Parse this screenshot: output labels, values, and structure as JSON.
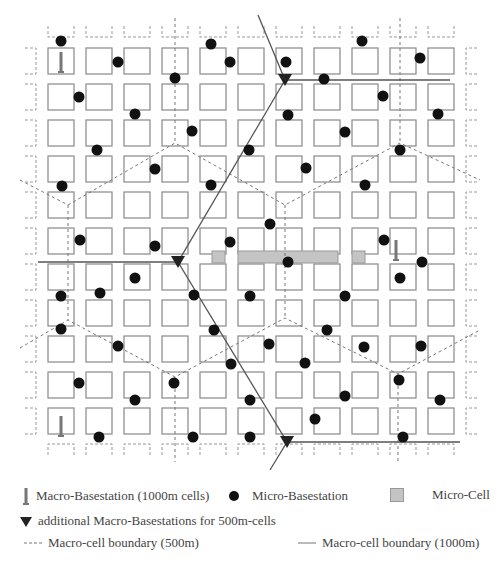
{
  "diagram": {
    "grid": {
      "cols": 11,
      "rows": 11,
      "x0": 48,
      "y0": 48,
      "pitch_x": 38,
      "pitch_y": 36,
      "cell_w": 26,
      "cell_h": 26
    },
    "colors": {
      "block_stroke": "#888888",
      "dot": "#111111",
      "micro_cell_fill": "#c4c4c4",
      "line": "#555555",
      "dashed": "#777777"
    },
    "macro_basestations_1000m": [
      [
        61,
        62
      ],
      [
        396,
        250
      ],
      [
        61,
        426
      ]
    ],
    "additional_macro_basestations_500m": [
      [
        285,
        80
      ],
      [
        178,
        262
      ],
      [
        287,
        442
      ]
    ],
    "micro_basestations": [
      [
        61,
        41
      ],
      [
        118,
        62
      ],
      [
        211,
        44
      ],
      [
        230,
        62
      ],
      [
        286,
        62
      ],
      [
        362,
        41
      ],
      [
        420,
        58
      ],
      [
        79,
        97
      ],
      [
        175,
        78
      ],
      [
        324,
        79
      ],
      [
        383,
        96
      ],
      [
        135,
        114
      ],
      [
        288,
        115
      ],
      [
        438,
        114
      ],
      [
        97,
        150
      ],
      [
        192,
        131
      ],
      [
        345,
        132
      ],
      [
        62,
        186
      ],
      [
        155,
        169
      ],
      [
        249,
        150
      ],
      [
        400,
        150
      ],
      [
        211,
        185
      ],
      [
        306,
        168
      ],
      [
        365,
        185
      ],
      [
        80,
        240
      ],
      [
        270,
        224
      ],
      [
        155,
        246
      ],
      [
        384,
        240
      ],
      [
        230,
        242
      ],
      [
        288,
        262
      ],
      [
        422,
        262
      ],
      [
        61,
        296
      ],
      [
        135,
        278
      ],
      [
        194,
        295
      ],
      [
        345,
        296
      ],
      [
        400,
        278
      ],
      [
        100,
        293
      ],
      [
        250,
        296
      ],
      [
        61,
        329
      ],
      [
        118,
        346
      ],
      [
        214,
        330
      ],
      [
        269,
        344
      ],
      [
        327,
        330
      ],
      [
        364,
        347
      ],
      [
        421,
        346
      ],
      [
        79,
        383
      ],
      [
        174,
        383
      ],
      [
        231,
        364
      ],
      [
        305,
        363
      ],
      [
        399,
        380
      ],
      [
        135,
        400
      ],
      [
        250,
        400
      ],
      [
        345,
        396
      ],
      [
        440,
        400
      ],
      [
        99,
        437
      ],
      [
        193,
        437
      ],
      [
        250,
        437
      ],
      [
        315,
        419
      ],
      [
        403,
        437
      ]
    ],
    "micro_cells": [
      [
        212,
        251,
        13,
        12
      ],
      [
        238,
        251,
        100,
        12
      ],
      [
        352,
        251,
        13,
        12
      ]
    ],
    "solid_lines": [
      [
        [
          258,
          15
        ],
        [
          285,
          80
        ],
        [
          178,
          262
        ],
        [
          287,
          442
        ],
        [
          270,
          470
        ]
      ],
      [
        [
          285,
          80
        ],
        [
          450,
          80
        ]
      ],
      [
        [
          38,
          262
        ],
        [
          178,
          262
        ]
      ],
      [
        [
          287,
          442
        ],
        [
          460,
          442
        ]
      ]
    ],
    "dashed_lines": [
      [
        [
          20,
          180
        ],
        [
          68,
          205
        ],
        [
          175,
          143
        ],
        [
          285,
          205
        ],
        [
          400,
          143
        ],
        [
          480,
          180
        ]
      ],
      [
        [
          20,
          348
        ],
        [
          68,
          320
        ],
        [
          175,
          377
        ],
        [
          285,
          318
        ],
        [
          398,
          374
        ],
        [
          480,
          330
        ]
      ],
      [
        [
          175,
          18
        ],
        [
          175,
          143
        ]
      ],
      [
        [
          400,
          18
        ],
        [
          400,
          143
        ]
      ],
      [
        [
          68,
          205
        ],
        [
          68,
          320
        ]
      ],
      [
        [
          285,
          205
        ],
        [
          285,
          318
        ]
      ],
      [
        [
          175,
          377
        ],
        [
          175,
          462
        ]
      ],
      [
        [
          398,
          374
        ],
        [
          398,
          462
        ]
      ]
    ]
  },
  "legend": {
    "macro_basestation": "Macro-Basestation (1000m cells)",
    "micro_basestation": "Micro-Basestation",
    "micro_cell": "Micro-Cell",
    "additional_macro": "additional Macro-Basestations for 500m-cells",
    "boundary_500": "Macro-cell boundary (500m)",
    "boundary_1000": "Macro-cell boundary (1000m)"
  }
}
